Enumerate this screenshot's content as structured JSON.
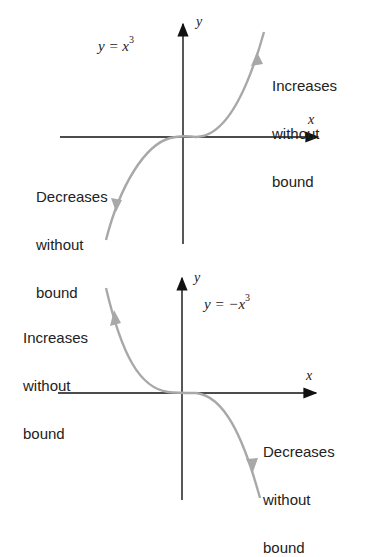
{
  "colors": {
    "axis": "#111111",
    "curve": "#a8a8a8",
    "text": "#222222",
    "background": "#ffffff"
  },
  "graphs": [
    {
      "equation_lhs": "y = x",
      "equation_exp": "3",
      "x_axis_label": "x",
      "y_axis_label": "y",
      "annotations": {
        "right_upper": [
          "Increases",
          "without",
          "bound"
        ],
        "left_lower": [
          "Decreases",
          "without",
          "bound"
        ]
      }
    },
    {
      "equation_lhs": "y = −x",
      "equation_exp": "3",
      "x_axis_label": "x",
      "y_axis_label": "y",
      "annotations": {
        "left_upper": [
          "Increases",
          "without",
          "bound"
        ],
        "right_lower": [
          "Decreases",
          "without",
          "bound"
        ]
      }
    }
  ]
}
